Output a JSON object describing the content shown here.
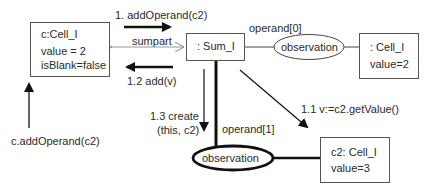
{
  "diagram": {
    "type": "UML collaboration diagram",
    "objects": {
      "c_cell": {
        "name": "c:Cell_I",
        "attr1": "value = 2",
        "attr2": "isBlank=false"
      },
      "sum": {
        "name": ": Sum_I"
      },
      "cell_right": {
        "name": ": Cell_I",
        "attr1": "value=2"
      },
      "c2_cell": {
        "name": "c2: Cell_I",
        "attr1": "value=3"
      },
      "observation_top": {
        "name": "observation"
      },
      "observation_bottom": {
        "name": "observation"
      }
    },
    "messages": {
      "m1": "1. addOperand(c2)",
      "m12": "1.2 add(v)",
      "m11": "1.1 v:=c2.getValue()",
      "m13_line1": "1.3 create",
      "m13_line2": "(this, c2)",
      "external": "c.addOperand(c2)"
    },
    "links": {
      "sumpart": "sumpart",
      "operand0": "operand[0]",
      "operand1": "operand[1]"
    }
  }
}
